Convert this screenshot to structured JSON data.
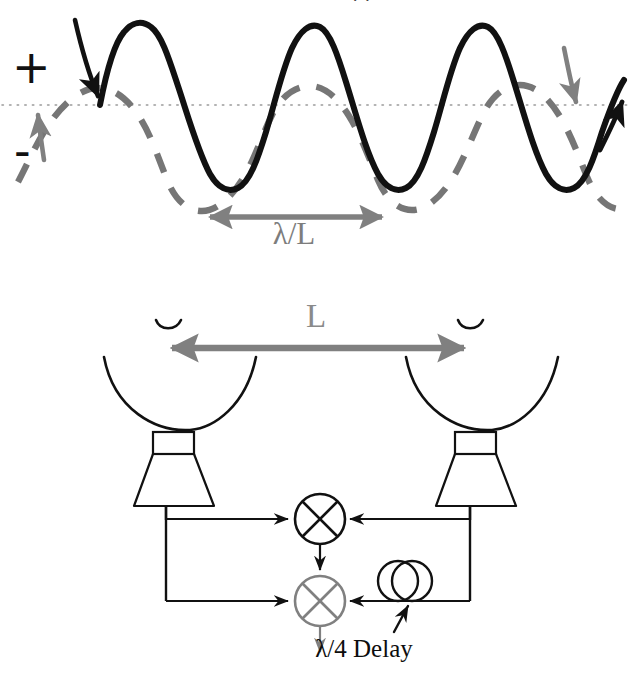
{
  "figure": {
    "title_clipped_fragment": "··",
    "background_color": "#ffffff",
    "width": 633,
    "height": 676
  },
  "colors": {
    "solid_wave": "#111111",
    "dashed_wave": "#767676",
    "gray_arrow": "#808080",
    "gray_label": "#7d7d7d",
    "black_line": "#111111",
    "gray_mixer": "#808080",
    "baseline_dotted": "#9a9a9a"
  },
  "top_panel": {
    "name": "interferometer-fringe-plot",
    "axis_plus_label": "+",
    "axis_minus_label": "-",
    "baseline_style": "dotted",
    "spacing_label": "λ/L",
    "solid_wave": {
      "name": "in-phase-fringe",
      "style": "solid",
      "color": "#111111",
      "phase_deg": 0,
      "cycles": 3.25
    },
    "dashed_wave": {
      "name": "quadrature-fringe",
      "style": "dashed",
      "color": "#767676",
      "phase_deg": 90,
      "cycles": 3.25
    },
    "arrows": [
      {
        "name": "solid-wave-arrow-left",
        "direction": "down",
        "color": "#111111"
      },
      {
        "name": "dashed-wave-arrow-left",
        "direction": "up",
        "color": "#808080"
      },
      {
        "name": "dashed-wave-arrow-right",
        "direction": "down",
        "color": "#808080"
      },
      {
        "name": "solid-wave-arrow-right",
        "direction": "up",
        "color": "#111111"
      }
    ]
  },
  "bottom_panel": {
    "name": "two-element-interferometer-schematic",
    "baseline_label": "L",
    "delay_label": "λ/4 Delay",
    "antennas": [
      {
        "name": "antenna-left",
        "type": "cassegrain-horn",
        "side": "left"
      },
      {
        "name": "antenna-right",
        "type": "cassegrain-horn",
        "side": "right"
      }
    ],
    "mixers": [
      {
        "name": "mixer-in-phase",
        "symbol": "circle-with-x",
        "color": "#111111",
        "output": "down"
      },
      {
        "name": "mixer-quadrature",
        "symbol": "circle-with-x",
        "color": "#808080",
        "output": "down"
      }
    ],
    "delay_element": {
      "name": "quarter-wave-delay-loop",
      "symbol": "two-overlapping-circles",
      "label": "λ/4 Delay"
    }
  }
}
